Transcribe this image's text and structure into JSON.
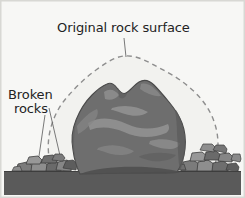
{
  "figure": {
    "type": "geology-diagram",
    "background_color": "#f7f7f5",
    "border_color": "#d8d8d4"
  },
  "labels": {
    "original_surface": "Original rock surface",
    "broken_rocks_line1": "Broken",
    "broken_rocks_line2": "rocks"
  },
  "elements": {
    "dashed_outline": {
      "name": "Original rock surface outline",
      "stroke_color": "#8e8e8e",
      "fill_color": "#f2f2ef",
      "dash_pattern": "5 4",
      "stroke_width": 1.4
    },
    "main_rock": {
      "name": "Weathered boulder",
      "fill_color": "#6e6e6e",
      "outline_color": "#4a4a4a",
      "highlight_color": "#8f8f8f",
      "highlight_color_bright": "#a3a3a3",
      "shadow_color": "#4f4f4f"
    },
    "ground": {
      "name": "Ground surface",
      "fill_color": "#5a5a5a",
      "top_edge_y": 172
    },
    "broken_rocks": {
      "name": "Broken rock fragments",
      "fill_color": "#7b7b7b",
      "fill_color_dark": "#5d5d5d",
      "fill_color_light": "#989898",
      "outline_color": "#3c3c3c",
      "left_cluster_count": 9,
      "right_cluster_count": 11
    },
    "leader_lines": {
      "stroke_color": "#6a6a6a",
      "stroke_width": 0.9,
      "count": 3
    }
  }
}
